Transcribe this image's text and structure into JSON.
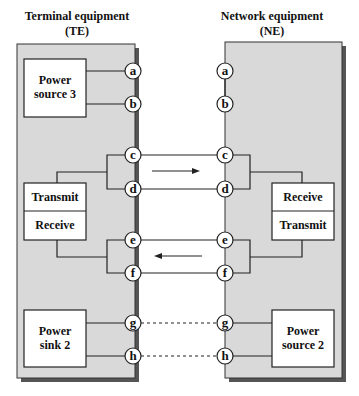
{
  "titles": {
    "te_line1": "Terminal equipment",
    "te_line2": "(TE)",
    "ne_line1": "Network equipment",
    "ne_line2": "(NE)"
  },
  "te_blocks": {
    "power_source_3": [
      "Power",
      "source 3"
    ],
    "transmit": "Transmit",
    "receive": "Receive",
    "power_sink_2": [
      "Power",
      "sink 2"
    ]
  },
  "ne_blocks": {
    "receive": "Receive",
    "transmit": "Transmit",
    "power_source_2": [
      "Power",
      "source 2"
    ]
  },
  "pins": [
    "a",
    "b",
    "c",
    "d",
    "e",
    "f",
    "g",
    "h"
  ],
  "arrows": {
    "cd_direction": "TE to NE",
    "ef_direction": "NE to TE"
  },
  "colors": {
    "box_fill": "#d9d9d9",
    "shadow": "#555555",
    "line": "#222222"
  }
}
